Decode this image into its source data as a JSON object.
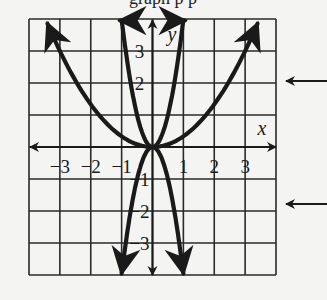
{
  "header": {
    "text": "graph p p"
  },
  "chart_data": {
    "type": "line",
    "title": "",
    "xlabel": "x",
    "ylabel": "y",
    "xlim": [
      -4,
      4
    ],
    "ylim": [
      -4,
      4
    ],
    "grid": true,
    "x_ticks": [
      "-3",
      "-2",
      "-1",
      "1",
      "2",
      "3"
    ],
    "y_ticks": [
      "3",
      "2",
      "-1",
      "-2",
      "-3"
    ],
    "series": [
      {
        "name": "wide upward parabola",
        "equation": "y = x^2/3",
        "a": 0.3333,
        "x_range": [
          -3.4,
          3.4
        ]
      },
      {
        "name": "narrow upward parabola",
        "equation": "y = 4x^2",
        "a": 4,
        "x_range": [
          -1.05,
          1.05
        ]
      },
      {
        "name": "narrow downward parabola",
        "equation": "y = -4x^2",
        "a": -4,
        "x_range": [
          -1.0,
          1.0
        ]
      }
    ],
    "annotations": [
      {
        "type": "pointer-arrow",
        "y_pixel": 81,
        "points_to": "left"
      },
      {
        "type": "pointer-arrow",
        "y_pixel": 204,
        "points_to": "left"
      }
    ]
  },
  "colors": {
    "ink": "#1a1a1a",
    "grid": "#2a2a2a",
    "background": "#f4f4f2"
  }
}
